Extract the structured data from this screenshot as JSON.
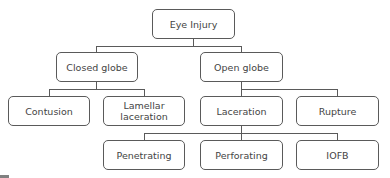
{
  "diagram": {
    "type": "tree",
    "nodes": {
      "root": {
        "label": "Eye Injury"
      },
      "closed": {
        "label": "Closed globe"
      },
      "open": {
        "label": "Open globe"
      },
      "contusion": {
        "label": "Contusion"
      },
      "lamellar": {
        "label": "Lamellar laceration"
      },
      "laceration": {
        "label": "Laceration"
      },
      "rupture": {
        "label": "Rupture"
      },
      "penetrating": {
        "label": "Penetrating"
      },
      "perforating": {
        "label": "Perforating"
      },
      "iofb": {
        "label": "IOFB"
      }
    },
    "edges": [
      [
        "root",
        "closed"
      ],
      [
        "root",
        "open"
      ],
      [
        "closed",
        "contusion"
      ],
      [
        "closed",
        "lamellar"
      ],
      [
        "open",
        "laceration"
      ],
      [
        "open",
        "rupture"
      ],
      [
        "laceration",
        "penetrating"
      ],
      [
        "laceration",
        "perforating"
      ],
      [
        "laceration",
        "iofb"
      ]
    ],
    "colors": {
      "border": "#5a5a5a",
      "text": "#444444",
      "line": "#5a5a5a",
      "background": "#ffffff"
    }
  }
}
